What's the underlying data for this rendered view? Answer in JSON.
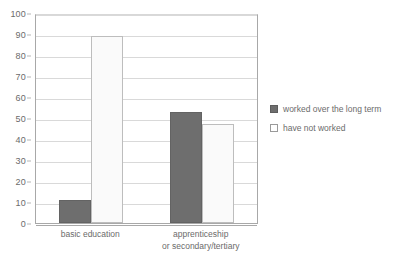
{
  "chart_data": {
    "type": "bar",
    "title": "",
    "xlabel": "",
    "ylabel": "",
    "ylim": [
      0,
      100
    ],
    "ytick_step": 10,
    "yticks": [
      100,
      90,
      80,
      70,
      60,
      50,
      40,
      30,
      20,
      10,
      0
    ],
    "grid": true,
    "legend_position": "right",
    "categories": [
      "basic education",
      "apprenticeship\nor secondary/tertiary"
    ],
    "category_lines": [
      [
        "basic education"
      ],
      [
        "apprenticeship",
        "or secondary/tertiary"
      ]
    ],
    "series": [
      {
        "name": "worked over the long term",
        "color": "#6e6e6e",
        "values": [
          11,
          53
        ]
      },
      {
        "name": "have not worked",
        "color": "#fafafa",
        "values": [
          89,
          47
        ]
      }
    ]
  },
  "axis": {
    "y_tick_labels": [
      "100",
      "90",
      "80",
      "70",
      "60",
      "50",
      "40",
      "30",
      "20",
      "10",
      "0"
    ]
  },
  "legend": {
    "items": [
      {
        "label": "worked over the long term",
        "swatch": "filled-dark-swatch"
      },
      {
        "label": "have not worked",
        "swatch": "outlined-white-swatch"
      }
    ]
  }
}
